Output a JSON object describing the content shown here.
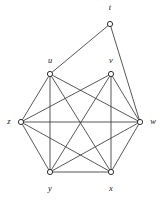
{
  "figure": {
    "background_color": "#ffffff",
    "edge_color": "#3a3a3a",
    "vertex_fill": "#ffffff",
    "vertex_stroke": "#2e2e2e",
    "vertex_radius": 2.6
  },
  "chart_data": {
    "type": "diagram",
    "subtype": "graph",
    "title": "",
    "vertex_count": 7,
    "edge_count": 16,
    "nodes": [
      {
        "id": "t",
        "label": "t",
        "x": 110,
        "y": 24,
        "label_x": 110,
        "label_y": 8,
        "label_anchor": "middle"
      },
      {
        "id": "u",
        "label": "u",
        "x": 50,
        "y": 74,
        "label_x": 50,
        "label_y": 61,
        "label_anchor": "middle"
      },
      {
        "id": "v",
        "label": "v",
        "x": 111,
        "y": 74,
        "label_x": 111,
        "label_y": 61,
        "label_anchor": "middle"
      },
      {
        "id": "z",
        "label": "z",
        "x": 21,
        "y": 122,
        "label_x": 9,
        "label_y": 122,
        "label_anchor": "middle"
      },
      {
        "id": "w",
        "label": "w",
        "x": 140,
        "y": 122,
        "label_x": 153,
        "label_y": 122,
        "label_anchor": "middle"
      },
      {
        "id": "y",
        "label": "y",
        "x": 50,
        "y": 172,
        "label_x": 50,
        "label_y": 189,
        "label_anchor": "middle"
      },
      {
        "id": "x",
        "label": "x",
        "x": 111,
        "y": 172,
        "label_x": 111,
        "label_y": 189,
        "label_anchor": "middle"
      }
    ],
    "edges": [
      {
        "from": "t",
        "to": "u"
      },
      {
        "from": "t",
        "to": "w"
      },
      {
        "from": "u",
        "to": "z"
      },
      {
        "from": "u",
        "to": "w"
      },
      {
        "from": "u",
        "to": "y"
      },
      {
        "from": "u",
        "to": "x"
      },
      {
        "from": "v",
        "to": "z"
      },
      {
        "from": "v",
        "to": "w"
      },
      {
        "from": "v",
        "to": "y"
      },
      {
        "from": "v",
        "to": "x"
      },
      {
        "from": "z",
        "to": "w"
      },
      {
        "from": "z",
        "to": "y"
      },
      {
        "from": "z",
        "to": "x"
      },
      {
        "from": "w",
        "to": "y"
      },
      {
        "from": "w",
        "to": "x"
      },
      {
        "from": "y",
        "to": "x"
      }
    ]
  }
}
